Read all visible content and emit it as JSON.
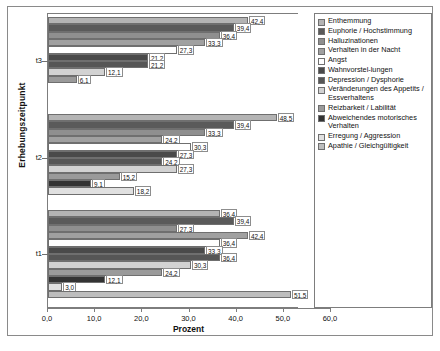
{
  "chart_data": {
    "type": "bar",
    "orientation": "horizontal",
    "title": "",
    "xlabel": "Prozent",
    "ylabel": "Erhebungszeitpunkt",
    "xlim": [
      0.0,
      60.0
    ],
    "xticks": [
      "0,0",
      "10,0",
      "20,0",
      "30,0",
      "40,0",
      "50,0",
      "60,0"
    ],
    "xtick_values": [
      0,
      10,
      20,
      30,
      40,
      50,
      60
    ],
    "grid": false,
    "legend_position": "right",
    "categories": [
      "t1",
      "t2",
      "t3"
    ],
    "series": [
      {
        "name": "Enthemmung",
        "color": "#b4b4b4",
        "values": [
          36.4,
          48.5,
          42.4
        ]
      },
      {
        "name": "Euphorie / Hochstimmung",
        "color": "#5a5a5a",
        "values": [
          39.4,
          39.4,
          39.4
        ]
      },
      {
        "name": "Halluzinationen",
        "color": "#8f8f8f",
        "values": [
          27.3,
          33.3,
          36.4
        ]
      },
      {
        "name": "Verhalten in der Nacht",
        "color": "#a0a0a0",
        "values": [
          42.4,
          24.2,
          33.3
        ]
      },
      {
        "name": "Angst",
        "color": "#ffffff",
        "values": [
          36.4,
          30.3,
          27.3
        ]
      },
      {
        "name": "Wahnvorstellungen",
        "color": "#4a4a4a",
        "values": [
          33.3,
          27.3,
          21.2
        ]
      },
      {
        "name": "Depression / Dysphorie",
        "color": "#565656",
        "values": [
          36.4,
          24.2,
          21.2
        ]
      },
      {
        "name": "Veränderungen des Appetits / Essverhaltens",
        "color": "#d2d2d2",
        "values": [
          30.3,
          27.3,
          12.1
        ]
      },
      {
        "name": "Reizbarkeit / Labilität",
        "color": "#9a9a9a",
        "values": [
          24.2,
          15.2,
          6.1
        ]
      },
      {
        "name": "Abweichendes motorisches Verhalten",
        "color": "#333333",
        "values": [
          12.1,
          9.1,
          0.0
        ]
      },
      {
        "name": "Erregung / Aggression",
        "color": "#e0e0e0",
        "values": [
          3.0,
          18.2,
          0.0
        ]
      },
      {
        "name": "Apathie / Gleichgültigkeit",
        "color": "#bdbdbd",
        "values": [
          51.5,
          0.0,
          0.0
        ]
      }
    ],
    "value_labels": {
      "t3": [
        "42,4",
        "39,4",
        "36,4",
        "33,3",
        "27,3",
        "21,2",
        "21,2",
        "12,1",
        "6,1"
      ],
      "t2": [
        "48,5",
        "39,4",
        "33,3",
        "24,2",
        "30,3",
        "27,3",
        "24,2",
        "27,3",
        "15,2",
        "9,1",
        "18,2"
      ],
      "t1": [
        "36,4",
        "39,4",
        "27,3",
        "42,4",
        "36,4",
        "33,3",
        "36,4",
        "30,3",
        "24,2",
        "12,1",
        "3,0",
        "51,5"
      ]
    }
  },
  "legend": {
    "items": [
      {
        "label": "Enthemmung"
      },
      {
        "label": "Euphorie / Hochstimmung"
      },
      {
        "label": "Halluzinationen"
      },
      {
        "label": "Verhalten in der Nacht"
      },
      {
        "label": "Angst"
      },
      {
        "label": "Wahnvorstel-lungen"
      },
      {
        "label": "Depression / Dysphorie"
      },
      {
        "label": "Veränderungen des Appetits / Essverhaltens"
      },
      {
        "label": "Reizbarkeit / Labilität"
      },
      {
        "label": "Abweichendes motorisches Verhalten"
      },
      {
        "label": "Erregung / Aggression"
      },
      {
        "label": "Apathie / Gleichgültigkeit"
      }
    ]
  }
}
